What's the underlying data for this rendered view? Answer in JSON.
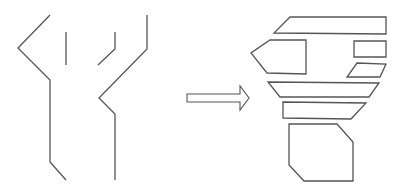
{
  "diagram": {
    "stroke_color": "#555555",
    "background": "#ffffff",
    "left_figure": {
      "polylines": [
        {
          "id": "outer-left-line",
          "points": "50,15 18,48 50,80 50,162 66,180"
        },
        {
          "id": "inner-left-line",
          "points": "66,32 66,65"
        },
        {
          "id": "inner-right-line",
          "points": "115,32 115,49 98,65"
        },
        {
          "id": "outer-right-line",
          "points": "147,15 147,49 99,98 115,114 115,180"
        }
      ]
    },
    "arrow": {
      "icon": "right-arrow-icon",
      "points": "187,94 240,94 240,86 249,98 240,110 240,102 187,102"
    },
    "right_figure": {
      "polygons": [
        {
          "id": "top-parallelogram",
          "points": "290,17 386,17 386,34 274,33"
        },
        {
          "id": "pentagon",
          "points": "270,40 306,40 306,74 267,73 251,53"
        },
        {
          "id": "small-rectangle",
          "points": "354,41 386,41 386,57 354,57"
        },
        {
          "id": "small-parallelogram",
          "points": "357,63 386,64 380,77 347,77"
        },
        {
          "id": "wide-trapezoid",
          "points": "268,82 379,83 369,97 280,97"
        },
        {
          "id": "lower-parallelogram",
          "points": "283,102 366,103 351,119 283,118"
        },
        {
          "id": "bottom-hexagon",
          "points": "289,124 337,124 353,142 353,181 304,181 289,165"
        }
      ]
    }
  }
}
